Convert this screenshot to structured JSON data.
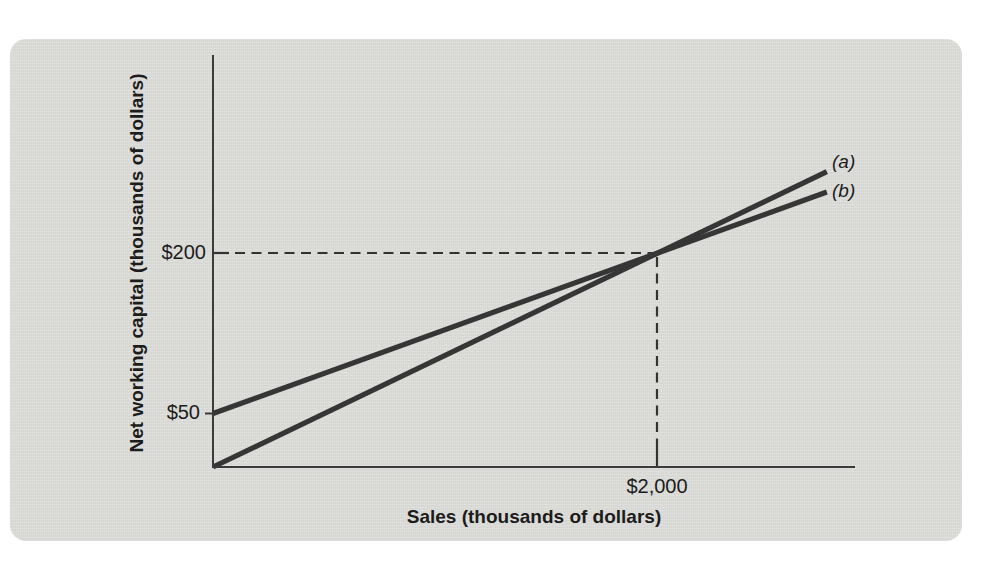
{
  "figure": {
    "background_color": "#ffffff",
    "panel_color": "#dbdbd8",
    "axis_color": "#3a3a3a",
    "series_line_color": "#363636",
    "dashed_line_color": "#333333",
    "text_color": "#1c1c1c"
  },
  "chart_data": {
    "type": "line",
    "title": "",
    "xlabel": "Sales (thousands of dollars)",
    "ylabel": "Net working capital (thousands of dollars)",
    "xlim": [
      0,
      2890
    ],
    "ylim": [
      0,
      385
    ],
    "grid": false,
    "legend_position": "inline-at-line-ends",
    "x_ticks": [
      {
        "value": 2000,
        "label": "$2,000"
      }
    ],
    "y_ticks": [
      {
        "value": 200,
        "label": "$200"
      },
      {
        "value": 50,
        "label": "$50"
      }
    ],
    "series": [
      {
        "name": "(a)",
        "points": [
          [
            0,
            0
          ],
          [
            2765,
            276
          ]
        ],
        "key_points": [
          [
            0,
            0
          ],
          [
            2000,
            200
          ]
        ]
      },
      {
        "name": "(b)",
        "points": [
          [
            0,
            50
          ],
          [
            2765,
            257
          ]
        ],
        "key_points": [
          [
            0,
            50
          ],
          [
            2000,
            200
          ]
        ]
      }
    ],
    "intersection": {
      "x": 2000,
      "y": 200
    },
    "reference_lines": {
      "style": "dashed",
      "horizontal_at_y": 200,
      "vertical_at_x": 2000
    }
  }
}
